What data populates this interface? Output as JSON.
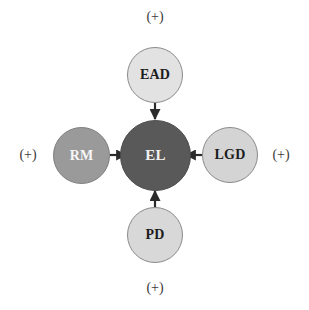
{
  "diagram": {
    "type": "hub-and-spoke",
    "center": {
      "id": "EL",
      "label": "EL",
      "fill": "#595959",
      "text_color": "#f2f2f2"
    },
    "nodes": [
      {
        "id": "EAD",
        "label": "EAD",
        "position": "top",
        "fill": "#e2e2e2",
        "text_color": "#1c1c1c"
      },
      {
        "id": "RM",
        "label": "RM",
        "position": "left",
        "fill": "#9a9a9a",
        "text_color": "#f7f7f7"
      },
      {
        "id": "LGD",
        "label": "LGD",
        "position": "right",
        "fill": "#d4d4d4",
        "text_color": "#1c1c1c"
      },
      {
        "id": "PD",
        "label": "PD",
        "position": "bottom",
        "fill": "#d8d8d8",
        "text_color": "#1c1c1c"
      }
    ],
    "edges": [
      {
        "from": "EAD",
        "to": "EL",
        "direction": "down",
        "sign": "(+)"
      },
      {
        "from": "RM",
        "to": "EL",
        "direction": "right",
        "sign": "(+)"
      },
      {
        "from": "LGD",
        "to": "EL",
        "direction": "left",
        "sign": "(+)"
      },
      {
        "from": "PD",
        "to": "EL",
        "direction": "up",
        "sign": "(+)"
      }
    ],
    "signs": {
      "top": "(+)",
      "right": "(+)",
      "bottom": "(+)",
      "left": "(+)"
    },
    "stroke_color": "#2b2b2b",
    "background": "#ffffff"
  }
}
